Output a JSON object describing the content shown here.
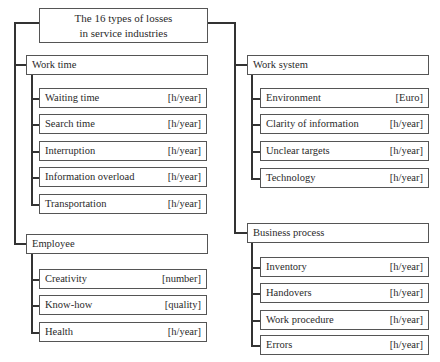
{
  "title": {
    "line1": "The 16 types of losses",
    "line2": "in service industries"
  },
  "categories": [
    {
      "name": "Work time",
      "items": [
        {
          "label": "Waiting time",
          "unit": "[h/year]"
        },
        {
          "label": "Search time",
          "unit": "[h/year]"
        },
        {
          "label": "Interruption",
          "unit": "[h/year]"
        },
        {
          "label": "Information overload",
          "unit": "[h/year]"
        },
        {
          "label": "Transportation",
          "unit": "[h/year]"
        }
      ]
    },
    {
      "name": "Employee",
      "items": [
        {
          "label": "Creativity",
          "unit": "[number]"
        },
        {
          "label": "Know-how",
          "unit": "[quality]"
        },
        {
          "label": "Health",
          "unit": "[h/year]"
        }
      ]
    },
    {
      "name": "Work system",
      "items": [
        {
          "label": "Environment",
          "unit": "[Euro]"
        },
        {
          "label": "Clarity of information",
          "unit": "[h/year]"
        },
        {
          "label": "Unclear targets",
          "unit": "[h/year]"
        },
        {
          "label": "Technology",
          "unit": "[h/year]"
        }
      ]
    },
    {
      "name": "Business process",
      "items": [
        {
          "label": "Inventory",
          "unit": "[h/year]"
        },
        {
          "label": "Handovers",
          "unit": "[h/year]"
        },
        {
          "label": "Work procedure",
          "unit": "[h/year]"
        },
        {
          "label": "Errors",
          "unit": "[h/year]"
        }
      ]
    }
  ]
}
